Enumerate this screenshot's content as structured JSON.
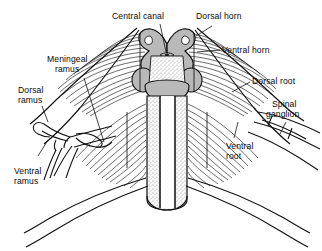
{
  "figure": {
    "type": "anatomical-line-diagram",
    "background_color": "#ffffff",
    "ink_color": "#0a0a0a",
    "gray_matter_fill": "#b9b9b9",
    "white_matter_fill": "#f2f2f2",
    "stipple_fill": "#dcdcdc"
  },
  "labels": {
    "central_canal": "Central canal",
    "dorsal_horn": "Dorsal horn",
    "ventral_horn": "Ventral horn",
    "dorsal_root": "Dorsal root",
    "spinal_ganglion_line1": "Spinal",
    "spinal_ganglion_line2": "ganglion",
    "ventral_root_line1": "Ventral",
    "ventral_root_line2": "root",
    "meningeal_ramus_line1": "Meningeal",
    "meningeal_ramus_line2": "ramus",
    "dorsal_ramus_line1": "Dorsal",
    "dorsal_ramus_line2": "ramus",
    "ventral_ramus_line1": "Ventral",
    "ventral_ramus_line2": "ramus"
  },
  "structures": [
    {
      "name": "central-canal",
      "side": "center"
    },
    {
      "name": "dorsal-horn",
      "side": "both"
    },
    {
      "name": "ventral-horn",
      "side": "both"
    },
    {
      "name": "dorsal-root",
      "side": "both"
    },
    {
      "name": "spinal-ganglion",
      "side": "both"
    },
    {
      "name": "ventral-root",
      "side": "both"
    },
    {
      "name": "meningeal-ramus",
      "side": "left"
    },
    {
      "name": "dorsal-ramus",
      "side": "left"
    },
    {
      "name": "ventral-ramus",
      "side": "left"
    },
    {
      "name": "spinal-cord-column",
      "side": "center"
    }
  ]
}
